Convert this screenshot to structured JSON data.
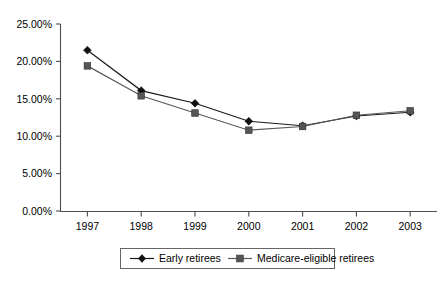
{
  "chart_data": {
    "type": "line",
    "title": "",
    "subtitle": "",
    "xlabel": "",
    "ylabel": "",
    "categories": [
      "1997",
      "1998",
      "1999",
      "2000",
      "2001",
      "2002",
      "2003"
    ],
    "ylim": [
      0,
      25
    ],
    "ytick_labels": [
      "0.00%",
      "5.00%",
      "10.00%",
      "15.00%",
      "20.00%",
      "25.00%"
    ],
    "ytick_values": [
      0,
      5,
      10,
      15,
      20,
      25
    ],
    "grid": false,
    "legend_position": "bottom",
    "series": [
      {
        "name": "Early retirees",
        "marker": "diamond",
        "color": "#1a1a1a",
        "values": [
          21.5,
          16.1,
          14.4,
          12.0,
          11.4,
          12.7,
          13.2
        ]
      },
      {
        "name": "Medicare-eligible retirees",
        "marker": "square",
        "color": "#595959",
        "values": [
          19.4,
          15.4,
          13.1,
          10.8,
          11.3,
          12.8,
          13.4
        ]
      }
    ]
  },
  "legend": {
    "items": [
      {
        "label": "Early retirees",
        "marker": "diamond-marker-icon"
      },
      {
        "label": "Medicare-eligible retirees",
        "marker": "square-marker-icon"
      }
    ]
  },
  "axes": {
    "y_labels": [
      "25.00%",
      "20.00%",
      "15.00%",
      "10.00%",
      "5.00%",
      "0.00%"
    ],
    "x_labels": [
      "1997",
      "1998",
      "1999",
      "2000",
      "2001",
      "2002",
      "2003"
    ]
  },
  "colors": {
    "axis": "#4d4d4d",
    "series_primary": "#1a1a1a",
    "series_secondary": "#595959",
    "background": "#ffffff",
    "legend_border": "#666666"
  }
}
